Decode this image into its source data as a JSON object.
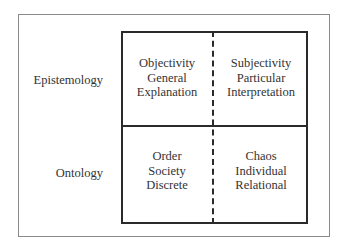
{
  "rows": [
    {
      "label": "Epistemology"
    },
    {
      "label": "Ontology"
    }
  ],
  "cells": {
    "top_left": [
      "Objectivity",
      "General",
      "Explanation"
    ],
    "top_right": [
      "Subjectivity",
      "Particular",
      "Interpretation"
    ],
    "bottom_left": [
      "Order",
      "Society",
      "Discrete"
    ],
    "bottom_right": [
      "Chaos",
      "Individual",
      "Relational"
    ]
  }
}
